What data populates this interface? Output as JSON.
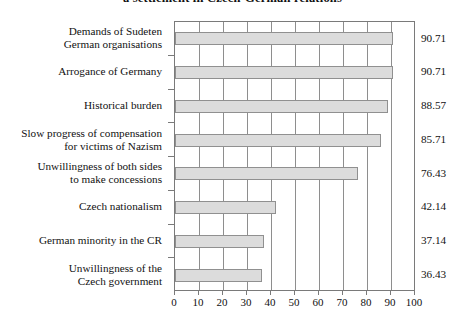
{
  "chart_data": {
    "type": "bar",
    "orientation": "horizontal",
    "title": "a settlement in Czech-German relations",
    "xlabel": "",
    "ylabel": "",
    "xlim": [
      0,
      100
    ],
    "xticks": [
      0,
      10,
      20,
      30,
      40,
      50,
      60,
      70,
      80,
      90,
      100
    ],
    "grid": "vertical",
    "legend": "none",
    "bar_fill_color": "#dcdcdc",
    "bar_border_color": "#909090",
    "categories": [
      "Demands of Sudeten German organisations",
      "Arrogance of Germany",
      "Historical burden",
      "Slow progress of compensation for victims of Nazism",
      "Unwillingness of both sides to make concessions",
      "Czech nationalism",
      "German minority in the CR",
      "Unwillingness of the Czech government"
    ],
    "category_lines": [
      [
        "Demands of Sudeten",
        "German organisations"
      ],
      [
        "Arrogance of Germany"
      ],
      [
        "Historical burden"
      ],
      [
        "Slow progress of compensation",
        "for victims of Nazism"
      ],
      [
        "Unwillingness of both sides",
        "to make concessions"
      ],
      [
        "Czech nationalism"
      ],
      [
        "German minority in the CR"
      ],
      [
        "Unwillingness of the",
        "Czech government"
      ]
    ],
    "values": [
      90.71,
      90.71,
      88.57,
      85.71,
      76.43,
      42.14,
      37.14,
      36.43
    ],
    "value_labels": [
      "90.71",
      "90.71",
      "88.57",
      "85.71",
      "76.43",
      "42.14",
      "37.14",
      "36.43"
    ],
    "xtick_labels": [
      "0",
      "10",
      "20",
      "30",
      "40",
      "50",
      "60",
      "70",
      "80",
      "90",
      "100"
    ]
  }
}
